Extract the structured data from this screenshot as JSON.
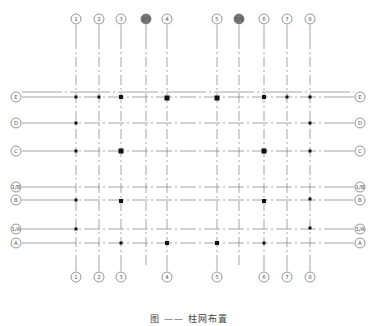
{
  "drawing": {
    "type": "structural column grid plan",
    "caption": "图 ——  柱网布置",
    "line_color": "#6a6a6a",
    "column_color": "#111111",
    "grid_columns": [
      {
        "label": "1",
        "x": 76,
        "top_bubble": true,
        "bottom_bubble": true
      },
      {
        "label": "2",
        "x": 99,
        "top_bubble": true,
        "bottom_bubble": true
      },
      {
        "label": "3",
        "x": 121,
        "top_bubble": true,
        "bottom_bubble": true
      },
      {
        "label": "2/3",
        "x": 146,
        "top_bubble": true,
        "bottom_bubble": false
      },
      {
        "label": "4",
        "x": 167,
        "top_bubble": true,
        "bottom_bubble": true
      },
      {
        "label": "5",
        "x": 217,
        "top_bubble": true,
        "bottom_bubble": true
      },
      {
        "label": "5/6",
        "x": 239,
        "top_bubble": true,
        "bottom_bubble": false
      },
      {
        "label": "6",
        "x": 264,
        "top_bubble": true,
        "bottom_bubble": true
      },
      {
        "label": "7",
        "x": 287,
        "top_bubble": true,
        "bottom_bubble": true
      },
      {
        "label": "8",
        "x": 310,
        "top_bubble": true,
        "bottom_bubble": true
      }
    ],
    "grid_rows": [
      {
        "label": "E",
        "y": 97
      },
      {
        "label": "D",
        "y": 123
      },
      {
        "label": "C",
        "y": 151
      },
      {
        "label": "1/B",
        "y": 187
      },
      {
        "label": "B",
        "y": 200
      },
      {
        "label": "1/A",
        "y": 229
      },
      {
        "label": "A",
        "y": 243
      }
    ],
    "extra_line_y": 92,
    "columns": [
      {
        "x": 76,
        "y": 97,
        "size": 3
      },
      {
        "x": 99,
        "y": 97,
        "size": 3
      },
      {
        "x": 121,
        "y": 97,
        "size": 4
      },
      {
        "x": 167,
        "y": 98,
        "size": 5
      },
      {
        "x": 217,
        "y": 98,
        "size": 5
      },
      {
        "x": 264,
        "y": 97,
        "size": 4
      },
      {
        "x": 287,
        "y": 97,
        "size": 3
      },
      {
        "x": 310,
        "y": 97,
        "size": 3
      },
      {
        "x": 76,
        "y": 123,
        "size": 3
      },
      {
        "x": 310,
        "y": 123,
        "size": 3
      },
      {
        "x": 76,
        "y": 151,
        "size": 3
      },
      {
        "x": 121,
        "y": 151,
        "size": 5
      },
      {
        "x": 264,
        "y": 151,
        "size": 5
      },
      {
        "x": 310,
        "y": 151,
        "size": 3
      },
      {
        "x": 76,
        "y": 200,
        "size": 3
      },
      {
        "x": 121,
        "y": 201,
        "size": 4
      },
      {
        "x": 264,
        "y": 201,
        "size": 4
      },
      {
        "x": 310,
        "y": 199,
        "size": 3
      },
      {
        "x": 76,
        "y": 229,
        "size": 3
      },
      {
        "x": 310,
        "y": 228,
        "size": 3
      },
      {
        "x": 121,
        "y": 243,
        "size": 3
      },
      {
        "x": 167,
        "y": 243,
        "size": 4
      },
      {
        "x": 217,
        "y": 243,
        "size": 4
      },
      {
        "x": 264,
        "y": 243,
        "size": 3
      }
    ],
    "layout": {
      "top_bubble_y": 19,
      "bottom_bubble_y": 277,
      "left_bubble_x": 16,
      "right_bubble_x": 360,
      "bubble_r": 5,
      "line_x_start": 22,
      "line_x_end": 354,
      "line_y_start": 25,
      "line_y_end": 271
    }
  }
}
